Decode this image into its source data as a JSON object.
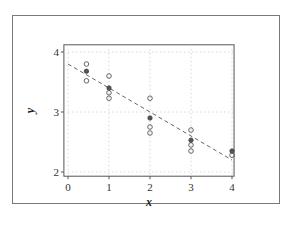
{
  "chart_data": {
    "type": "scatter",
    "title": "",
    "xlabel": "x",
    "ylabel": "y",
    "xlim": [
      -0.1,
      4.05
    ],
    "ylim": [
      1.93,
      4.12
    ],
    "xticks": [
      0,
      1,
      2,
      3,
      4
    ],
    "yticks": [
      2,
      3,
      4
    ],
    "xtick_labels": [
      "0",
      "1",
      "2",
      "3",
      "4"
    ],
    "ytick_labels": [
      "2",
      "3",
      "4"
    ],
    "grid": true,
    "series": [
      {
        "name": "observations",
        "marker": "open-circle",
        "points": [
          {
            "x": 0.45,
            "y": 3.8
          },
          {
            "x": 0.45,
            "y": 3.52
          },
          {
            "x": 1,
            "y": 3.6
          },
          {
            "x": 1,
            "y": 3.32
          },
          {
            "x": 1,
            "y": 3.23
          },
          {
            "x": 2,
            "y": 3.23
          },
          {
            "x": 2,
            "y": 2.75
          },
          {
            "x": 2,
            "y": 2.65
          },
          {
            "x": 3,
            "y": 2.7
          },
          {
            "x": 3,
            "y": 2.45
          },
          {
            "x": 3,
            "y": 2.35
          },
          {
            "x": 4,
            "y": 2.28
          }
        ]
      },
      {
        "name": "group means",
        "marker": "filled-circle",
        "points": [
          {
            "x": 0.45,
            "y": 3.68
          },
          {
            "x": 1,
            "y": 3.4
          },
          {
            "x": 2,
            "y": 2.9
          },
          {
            "x": 3,
            "y": 2.53
          },
          {
            "x": 4,
            "y": 2.35
          }
        ]
      }
    ],
    "fit_line": {
      "style": "dashed",
      "x": [
        0,
        4
      ],
      "y": [
        3.8,
        2.2
      ]
    }
  }
}
